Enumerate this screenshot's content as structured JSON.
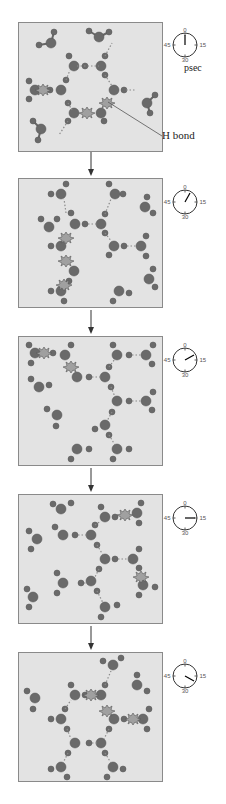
{
  "diagram": {
    "time_unit_label": "psec",
    "annotation_label": "H bond",
    "clock_ticks": [
      "0",
      "15",
      "30",
      "45"
    ],
    "frames": [
      {
        "index": 1,
        "clock_seconds": 0
      },
      {
        "index": 2,
        "clock_seconds": 5
      },
      {
        "index": 3,
        "clock_seconds": 11
      },
      {
        "index": 4,
        "clock_seconds": 15
      },
      {
        "index": 5,
        "clock_seconds": 20
      }
    ],
    "colors": {
      "panel_bg": "#e3e3e3",
      "panel_border": "#8a8a8a",
      "oxygen": "#6a6a6a",
      "hydrogen": "#707070",
      "bond_dots": "#8a8a8a",
      "breaking_bond": "#9a9a9a"
    }
  }
}
